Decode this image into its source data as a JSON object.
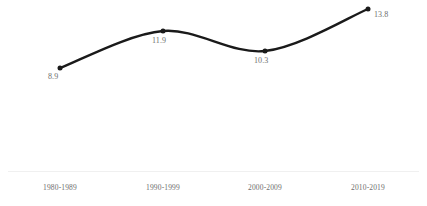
{
  "chart_data": {
    "type": "line",
    "title": "",
    "subtitle": "",
    "xlabel": "",
    "ylabel": "",
    "categories": [
      "1980-1989",
      "1990-1999",
      "2000-2009",
      "2010-2019"
    ],
    "values": [
      8.9,
      11.9,
      10.3,
      13.8
    ],
    "point_labels": [
      "8.9",
      "11.9",
      "10.3",
      "13.8"
    ],
    "series": [
      {
        "name": "",
        "values": [
          8.9,
          11.9,
          10.3,
          13.8
        ]
      }
    ],
    "ylim": [
      0,
      15.5
    ],
    "grid": false,
    "legend": false,
    "legend_position": "none",
    "smoothing": "spline",
    "markers": true,
    "axis": {
      "x_axis_visible": true,
      "y_axis_visible": false
    }
  },
  "style": {
    "line_color": "#1a1a1a",
    "marker_color": "#1a1a1a",
    "label_color": "#6e6e6e",
    "tick_color": "#6e6e6e",
    "axis_color": "#f0f0f0",
    "background": "#ffffff"
  },
  "points": [
    {
      "label": "8.9",
      "category": "1980-1989",
      "x": 60,
      "y": 68,
      "label_x": 48,
      "label_y": 72,
      "tick_x": 60
    },
    {
      "label": "11.9",
      "category": "1990-1999",
      "x": 163,
      "y": 31,
      "label_x": 152,
      "label_y": 36,
      "tick_x": 163
    },
    {
      "label": "10.3",
      "category": "2000-2009",
      "x": 265,
      "y": 51,
      "label_x": 254,
      "label_y": 56,
      "tick_x": 265
    },
    {
      "label": "13.8",
      "category": "2010-2019",
      "x": 368,
      "y": 9,
      "label_x": 374,
      "label_y": 10,
      "tick_x": 368
    }
  ]
}
